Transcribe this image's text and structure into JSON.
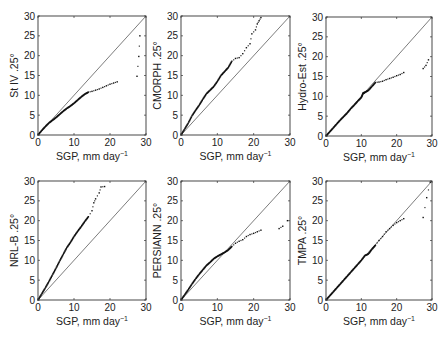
{
  "figure": {
    "xlabel": "SGP, mm day",
    "xlabel_sup": "−1",
    "ticks": [
      "0",
      "10",
      "20",
      "30"
    ],
    "yticks": [
      "0",
      "5",
      "10",
      "15",
      "20",
      "25",
      "30"
    ]
  },
  "chart_data": [
    {
      "type": "scatter",
      "title": "",
      "xlabel": "SGP, mm day^-1",
      "ylabel": "St IV .25°",
      "xlim": [
        0,
        30
      ],
      "ylim": [
        0,
        30
      ],
      "grid": false,
      "reference_line": "1:1",
      "points": [
        [
          0,
          0
        ],
        [
          1,
          1.1
        ],
        [
          2,
          2.1
        ],
        [
          3,
          3
        ],
        [
          4,
          3.7
        ],
        [
          5,
          4.4
        ],
        [
          6,
          5.2
        ],
        [
          7,
          6
        ],
        [
          8,
          6.7
        ],
        [
          9,
          7.3
        ],
        [
          10,
          8
        ],
        [
          11,
          8.8
        ],
        [
          12,
          9.6
        ],
        [
          13,
          10.3
        ],
        [
          14,
          10.8
        ],
        [
          15,
          11
        ],
        [
          16,
          11.3
        ],
        [
          17,
          11.6
        ],
        [
          18,
          12
        ],
        [
          19,
          12.4
        ],
        [
          20,
          12.8
        ],
        [
          21,
          13.1
        ],
        [
          22,
          13.4
        ],
        [
          27.5,
          14.8
        ],
        [
          28,
          19.8
        ],
        [
          28.3,
          25
        ]
      ]
    },
    {
      "type": "scatter",
      "xlabel": "SGP, mm day^-1",
      "ylabel": "CMORPH .25°",
      "xlim": [
        0,
        30
      ],
      "ylim": [
        0,
        30
      ],
      "grid": false,
      "reference_line": "1:1",
      "points": [
        [
          0,
          0
        ],
        [
          1,
          1.5
        ],
        [
          2,
          3
        ],
        [
          3,
          4.8
        ],
        [
          4,
          6.2
        ],
        [
          5,
          7.5
        ],
        [
          6,
          9
        ],
        [
          7,
          10.4
        ],
        [
          8,
          11.3
        ],
        [
          9,
          12.2
        ],
        [
          10,
          13.5
        ],
        [
          11,
          15
        ],
        [
          12,
          16
        ],
        [
          13,
          17
        ],
        [
          14,
          18.6
        ],
        [
          15,
          19.3
        ],
        [
          16,
          19.5
        ],
        [
          17,
          20.5
        ],
        [
          18,
          22
        ],
        [
          19,
          23
        ],
        [
          19.5,
          25.5
        ],
        [
          20.5,
          26.5
        ],
        [
          21,
          28
        ],
        [
          21.5,
          28.8
        ],
        [
          22,
          29.6
        ]
      ]
    },
    {
      "type": "scatter",
      "xlabel": "SGP, mm day^-1",
      "ylabel": "Hydro-Est .25°",
      "xlim": [
        0,
        30
      ],
      "ylim": [
        0,
        30
      ],
      "grid": false,
      "reference_line": "1:1",
      "points": [
        [
          0,
          0
        ],
        [
          1,
          1
        ],
        [
          2,
          2
        ],
        [
          3,
          3
        ],
        [
          4,
          4
        ],
        [
          5,
          4.9
        ],
        [
          6,
          5.8
        ],
        [
          7,
          6.9
        ],
        [
          8,
          7.8
        ],
        [
          9,
          8.8
        ],
        [
          10,
          9.7
        ],
        [
          10.5,
          10.8
        ],
        [
          11,
          11
        ],
        [
          12,
          11.5
        ],
        [
          13,
          12.5
        ],
        [
          14,
          13.5
        ],
        [
          15,
          13.6
        ],
        [
          16,
          13.8
        ],
        [
          17,
          14.2
        ],
        [
          18,
          14.5
        ],
        [
          19,
          14.8
        ],
        [
          20,
          15.2
        ],
        [
          21,
          15.5
        ],
        [
          22,
          16
        ],
        [
          27.5,
          17
        ],
        [
          28.3,
          17.8
        ],
        [
          29,
          19.2
        ]
      ]
    },
    {
      "type": "scatter",
      "xlabel": "SGP, mm day^-1",
      "ylabel": "NRL-B .25°",
      "xlim": [
        0,
        30
      ],
      "ylim": [
        0,
        30
      ],
      "grid": false,
      "reference_line": "1:1",
      "points": [
        [
          0,
          0
        ],
        [
          1,
          1.5
        ],
        [
          2,
          3
        ],
        [
          3,
          4.6
        ],
        [
          4,
          6.3
        ],
        [
          5,
          8
        ],
        [
          6,
          9.8
        ],
        [
          7,
          11.5
        ],
        [
          8,
          13.2
        ],
        [
          9,
          14.5
        ],
        [
          10,
          16
        ],
        [
          11,
          17.3
        ],
        [
          12,
          18.5
        ],
        [
          13,
          19.8
        ],
        [
          14,
          21
        ],
        [
          15,
          22.5
        ],
        [
          15.5,
          24.5
        ],
        [
          16,
          25.5
        ],
        [
          17,
          27
        ],
        [
          17.5,
          28.5
        ],
        [
          18.5,
          28.6
        ]
      ]
    },
    {
      "type": "scatter",
      "xlabel": "SGP, mm day^-1",
      "ylabel": "PERSIANN .25°",
      "xlim": [
        0,
        30
      ],
      "ylim": [
        0,
        30
      ],
      "grid": false,
      "reference_line": "1:1",
      "points": [
        [
          0,
          0
        ],
        [
          1,
          1.3
        ],
        [
          2,
          2.6
        ],
        [
          3,
          4
        ],
        [
          4,
          5.3
        ],
        [
          5,
          6.5
        ],
        [
          6,
          7.6
        ],
        [
          7,
          8.7
        ],
        [
          8,
          9.5
        ],
        [
          9,
          10.4
        ],
        [
          10,
          11
        ],
        [
          11,
          11.5
        ],
        [
          12,
          12
        ],
        [
          13,
          12.6
        ],
        [
          14,
          13.5
        ],
        [
          15,
          14.3
        ],
        [
          16,
          14.8
        ],
        [
          17,
          15.2
        ],
        [
          18,
          16
        ],
        [
          19,
          16.5
        ],
        [
          20,
          16.8
        ],
        [
          21,
          17.2
        ],
        [
          22,
          17.6
        ],
        [
          27,
          18
        ],
        [
          28,
          18.6
        ],
        [
          29.3,
          20
        ]
      ]
    },
    {
      "type": "scatter",
      "xlabel": "SGP, mm day^-1",
      "ylabel": "TMPA .25°",
      "xlim": [
        0,
        30
      ],
      "ylim": [
        0,
        30
      ],
      "grid": false,
      "reference_line": "1:1",
      "points": [
        [
          0,
          0
        ],
        [
          1,
          1
        ],
        [
          2,
          2
        ],
        [
          3,
          3
        ],
        [
          4,
          4
        ],
        [
          5,
          5
        ],
        [
          6,
          6
        ],
        [
          7,
          7
        ],
        [
          8,
          8
        ],
        [
          9,
          9
        ],
        [
          10,
          10
        ],
        [
          11,
          11.2
        ],
        [
          12,
          11.6
        ],
        [
          13,
          12.8
        ],
        [
          14,
          13.8
        ],
        [
          15,
          15
        ],
        [
          16,
          16
        ],
        [
          17,
          17.2
        ],
        [
          18,
          18
        ],
        [
          19,
          18.8
        ],
        [
          20,
          19.5
        ],
        [
          21,
          20
        ],
        [
          22,
          20.5
        ],
        [
          27.5,
          20.8
        ],
        [
          28.5,
          25.8
        ],
        [
          29.5,
          29.7
        ]
      ]
    }
  ]
}
